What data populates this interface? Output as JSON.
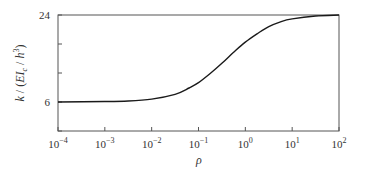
{
  "chart_data": {
    "type": "line",
    "title": "",
    "xlabel": "ρ",
    "ylabel": "k / (EI_c / h^3)",
    "xscale": "log",
    "xlim": [
      0.0001,
      100
    ],
    "ylim": [
      0,
      24
    ],
    "x_ticks": [
      {
        "value": -4,
        "label_base": "10",
        "label_exp": "−4"
      },
      {
        "value": -3,
        "label_base": "10",
        "label_exp": "−3"
      },
      {
        "value": -2,
        "label_base": "10",
        "label_exp": "−2"
      },
      {
        "value": -1,
        "label_base": "10",
        "label_exp": "−1"
      },
      {
        "value": 0,
        "label_base": "10",
        "label_exp": "0"
      },
      {
        "value": 1,
        "label_base": "10",
        "label_exp": "1"
      },
      {
        "value": 2,
        "label_base": "10",
        "label_exp": "2"
      }
    ],
    "y_ticks": [
      0,
      6,
      12,
      18,
      24
    ],
    "y_tick_labels": [
      {
        "value": 6,
        "label": "6"
      },
      {
        "value": 24,
        "label": "24"
      }
    ],
    "grid": false,
    "legend": null,
    "series": [
      {
        "name": "k",
        "color": "#1a1a1a",
        "x_log10": [
          -4,
          -3,
          -2.5,
          -2,
          -1.5,
          -1.2,
          -1,
          -0.75,
          -0.5,
          -0.25,
          0,
          0.25,
          0.5,
          0.75,
          1,
          1.5,
          2
        ],
        "values": [
          6.0,
          6.1,
          6.2,
          6.6,
          7.6,
          8.9,
          10.0,
          11.9,
          14.0,
          16.3,
          18.4,
          20.1,
          21.6,
          22.6,
          23.2,
          23.8,
          24.0
        ]
      }
    ]
  },
  "axes": {
    "xlabel": "ρ",
    "ylabel_parts": {
      "k": "k",
      "sep": " / (",
      "E": "EI",
      "sub": "c",
      "div": " / ",
      "h": "h",
      "sup": "3",
      "close": ")"
    },
    "ytick_24": "24",
    "ytick_6": "6"
  }
}
